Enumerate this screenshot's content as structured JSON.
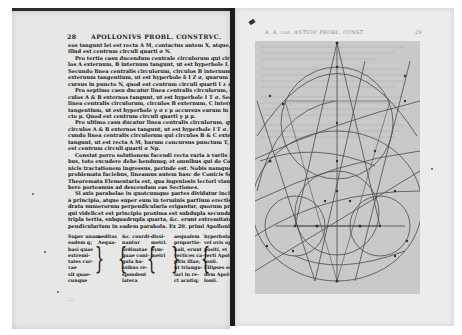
{
  "left_page": {
    "page_number": "28",
    "running_head": "APOLLONIVS PROBL. CONSTRVC.",
    "paragraphs": [
      {
        "indent": false,
        "lines": [
          "eos tangunt lei est recta A M, contactus autem X, atque,",
          "illud est centrum circuli quarti σ N."
        ]
      },
      {
        "indent": true,
        "lines": [
          "Pro tertio casu ducendum centrale circulorum qui circu-",
          "los A externum, B internum tangunt, ut est hyperbole L σ X;",
          "Secundo linea centralis circulorum, circulos B internum & C",
          "externum tangentium, ut est hyperbole δ I Z σ, quarum con-",
          "cursus in puncto N, quod est centrum circuli quarti I λ φ."
        ]
      },
      {
        "indent": true,
        "lines": [
          "Pro septimo casu ducatur linea centralis circulorum, qui cir-",
          "culos A & B externos tangunt, ut est hyperbole I T σ. Secundo",
          "linea centralis circulorum, circulos B externum, C internum",
          "tangentium, ut est hyperbole γ σ ε μ occursus earum in pun-",
          "cto μ. Quod est centrum circuli quarti γ μ μ."
        ]
      },
      {
        "indent": true,
        "lines": [
          "Pro ultimo casu ducatur linea centralis circulorum, qui",
          "circulos A & B externos tangunt, ut est hyperbole I T σ. Se-",
          "cundo linea centralis circulorum qui circulos B & C externos",
          "tangunt, ut est recta A M, harum concursus punctum T, quod",
          "est centrum circuli quarti σ Nμ."
        ]
      },
      {
        "indent": true,
        "lines": [
          "Constat porro solutionem facendi recta varia à variis modis tri-",
          "bus, toto excudere debe bendumq; et omnibus qui de Co-",
          "nicis tractationem ingressus, perinde est. Nobis namque solidi",
          "problemata faciebus, lineamus autem hasc de Conicis Sectionibus",
          "Theoremata Elementaria est, qua ingeniosis lectori viam pra-",
          "bere porteamus ad descendam eas Sectiones."
        ]
      },
      {
        "indent": true,
        "lines": [
          "Si axis parabolae in quotcumque partes dividatur incipiendo",
          "à principio, atque super eum in terminis partium erectis qua-",
          "drata numerorum perpendicularia erigantur, quorum primo",
          "qui videlicet est principio proxima est subdupla secunda, sub-",
          "tripla tertia, subquadrupla quarta, &c. erunt extremitates per-",
          "pendicularium in eadem parabola. Ex 20. primi Apollonii."
        ]
      }
    ],
    "table": {
      "columns": [
        [
          "Super unam",
          "eadem q;",
          "basi quae",
          "extremi-",
          "tates cur-",
          "vae",
          "sit quae-",
          "cunque"
        ],
        [
          "aeditas",
          "",
          "",
          "",
          "",
          "",
          "",
          "Aequa-"
        ],
        [
          "&c. coordi-",
          "nantur",
          "ordinatae",
          "quae coni-",
          "gula ba-",
          "ssibus re-",
          "spondent",
          "latera"
        ],
        [
          "dissi-",
          "metri.",
          "",
          "",
          "",
          "",
          "Sym-",
          "metri"
        ],
        [
          "aequalem",
          "proportio-",
          "nali, erunt",
          "vertices ca-",
          "pitis illae,",
          "ut triangu-",
          "lari in re-",
          "ct acutiq;"
        ],
        [
          "hyperbolae",
          "vel ovis op-",
          "positi, et",
          "verti Apol-",
          "lonii.",
          "Ellipses ea",
          "dem Apol-",
          "lonii."
        ]
      ]
    },
    "footer_mark": "∴∴"
  },
  "right_page": {
    "running_head": "A. A. con. ANTIOP. PROBL. CONST.",
    "page_number": "29",
    "diagram": {
      "description": "Geometric plate of Apollonius tangency problem: circles, hyperbolae, triangles",
      "labels": [
        "A",
        "B",
        "C",
        "D",
        "E",
        "F",
        "G",
        "H",
        "I",
        "K",
        "L",
        "M",
        "N",
        "T",
        "X",
        "Z"
      ]
    }
  },
  "colors": {
    "page_paper": "#e7e7e5",
    "plate_shade": "#c9c9c7",
    "ink": "#161616",
    "gutter": "#1c1c1c",
    "diagram_line": "#4a4a4a"
  }
}
